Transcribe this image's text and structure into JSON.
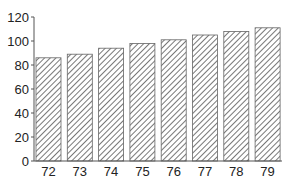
{
  "chart_data": {
    "type": "bar",
    "title": "",
    "xlabel": "",
    "ylabel": "",
    "categories": [
      "72",
      "73",
      "74",
      "75",
      "76",
      "77",
      "78",
      "79"
    ],
    "values": [
      86,
      89,
      94,
      98,
      101,
      105,
      108,
      111
    ],
    "ylim": [
      0,
      120
    ],
    "yticks": [
      0,
      20,
      40,
      60,
      80,
      100,
      120
    ],
    "grid": false,
    "legend": null,
    "bar_style": "diagonal-hatch",
    "colors": {
      "hatch": "#555555",
      "border": "#666666",
      "axis": "#555555",
      "fill": "#ffffff"
    }
  }
}
